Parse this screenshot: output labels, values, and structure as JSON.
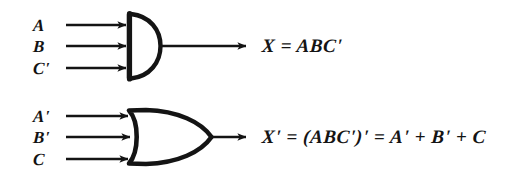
{
  "figure": {
    "background_color": "#ffffff",
    "ink_color": "#141414",
    "style": "hand-drawn scanned logic gate diagram"
  },
  "gates": [
    {
      "id": "and-gate",
      "type": "AND",
      "symbol_name": "and-gate-symbol",
      "inputs": [
        {
          "label": "A",
          "y": 25
        },
        {
          "label": "B",
          "y": 46
        },
        {
          "label": "C'",
          "y": 68
        }
      ],
      "output": {
        "label": "X = ABC'",
        "y": 46
      },
      "geometry": {
        "left": 127,
        "top": 14,
        "right": 160,
        "bottom": 78,
        "input_line_start": 66,
        "output_line_end": 247
      }
    },
    {
      "id": "or-gate",
      "type": "OR",
      "symbol_name": "or-gate-symbol",
      "inputs": [
        {
          "label": "A'",
          "y": 116
        },
        {
          "label": "B'",
          "y": 137
        },
        {
          "label": "C",
          "y": 159
        }
      ],
      "output": {
        "label": "X' = (ABC')' = A' + B' + C",
        "y": 137
      },
      "geometry": {
        "left": 127,
        "top": 110,
        "right": 212,
        "bottom": 164,
        "input_line_start": 66,
        "output_line_end": 247
      }
    }
  ],
  "labels": {
    "and_in_a": "A",
    "and_in_b": "B",
    "and_in_c": "C'",
    "and_out": "X = ABC'",
    "or_in_a": "A'",
    "or_in_b": "B'",
    "or_in_c": "C",
    "or_out": "X' = (ABC')' = A' + B' + C"
  }
}
